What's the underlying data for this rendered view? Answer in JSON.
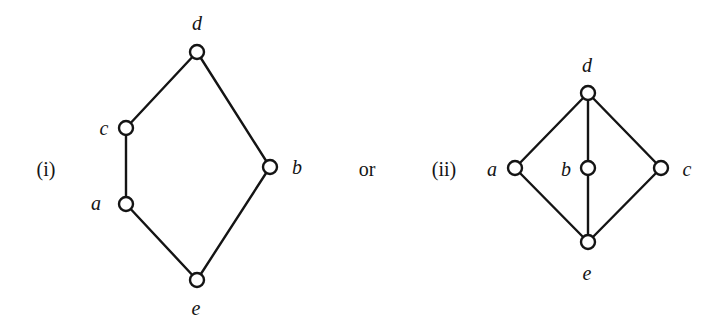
{
  "captions": {
    "first": "(i)",
    "connector": "or",
    "second": "(ii)"
  },
  "diagrams": [
    {
      "id": "i",
      "nodes": [
        {
          "name": "d",
          "label": "d"
        },
        {
          "name": "c",
          "label": "c"
        },
        {
          "name": "a",
          "label": "a"
        },
        {
          "name": "b",
          "label": "b"
        },
        {
          "name": "e",
          "label": "e"
        }
      ],
      "edges": [
        [
          "d",
          "c"
        ],
        [
          "c",
          "a"
        ],
        [
          "a",
          "e"
        ],
        [
          "d",
          "b"
        ],
        [
          "b",
          "e"
        ]
      ]
    },
    {
      "id": "ii",
      "nodes": [
        {
          "name": "d",
          "label": "d"
        },
        {
          "name": "a",
          "label": "a"
        },
        {
          "name": "b",
          "label": "b"
        },
        {
          "name": "c",
          "label": "c"
        },
        {
          "name": "e",
          "label": "e"
        }
      ],
      "edges": [
        [
          "d",
          "a"
        ],
        [
          "d",
          "b"
        ],
        [
          "d",
          "c"
        ],
        [
          "a",
          "e"
        ],
        [
          "b",
          "e"
        ],
        [
          "c",
          "e"
        ]
      ]
    }
  ],
  "colors": {
    "stroke": "#141414",
    "background": "#ffffff"
  }
}
